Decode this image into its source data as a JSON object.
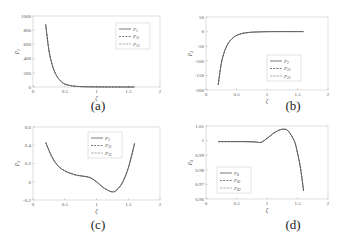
{
  "figure": {
    "captions": [
      "(a)",
      "(b)",
      "(c)",
      "(d)"
    ]
  },
  "chart_data": [
    {
      "type": "line",
      "panel": "(a)",
      "title": "",
      "xlabel": "ζ",
      "ylabel": "p1",
      "xlim": [
        0,
        2
      ],
      "ylim": [
        0,
        1000
      ],
      "xticks": [
        "0",
        "0.5",
        "1",
        "1.5",
        "2"
      ],
      "yticks": [
        "0",
        "200",
        "400",
        "600",
        "800",
        "1000"
      ],
      "legend": [
        "P1",
        "P11",
        "P12"
      ],
      "legend_position": "upper right",
      "grid": false,
      "x": [
        0.2,
        0.25,
        0.3,
        0.35,
        0.4,
        0.45,
        0.5,
        0.6,
        0.7,
        0.8,
        1.0,
        1.2,
        1.4,
        1.6
      ],
      "series": [
        {
          "name": "P1",
          "style": "solid",
          "values": [
            880,
            520,
            320,
            195,
            120,
            72,
            42,
            18,
            8,
            4,
            1,
            0.5,
            0.2,
            0.1
          ]
        },
        {
          "name": "P11",
          "style": "dashed",
          "values": [
            880,
            520,
            320,
            195,
            120,
            72,
            42,
            18,
            8,
            4,
            1,
            0.5,
            0.2,
            0.1
          ]
        },
        {
          "name": "P12",
          "style": "dotted",
          "values": [
            880,
            520,
            320,
            195,
            120,
            72,
            42,
            18,
            8,
            4,
            1,
            0.5,
            0.2,
            0.1
          ]
        }
      ]
    },
    {
      "type": "line",
      "panel": "(b)",
      "title": "",
      "xlabel": "ζ",
      "ylabel": "p2",
      "xlim": [
        0,
        2
      ],
      "ylim": [
        -200,
        50
      ],
      "xticks": [
        "0",
        "0.5",
        "1",
        "1.5",
        "2"
      ],
      "yticks": [
        "-200",
        "-150",
        "-100",
        "-50",
        "0",
        "50"
      ],
      "legend": [
        "P2",
        "P21",
        "P22"
      ],
      "legend_position": "lower right",
      "grid": false,
      "x": [
        0.2,
        0.25,
        0.3,
        0.35,
        0.4,
        0.45,
        0.5,
        0.6,
        0.7,
        0.8,
        1.0,
        1.2,
        1.4,
        1.6
      ],
      "series": [
        {
          "name": "P2",
          "style": "solid",
          "values": [
            -182,
            -110,
            -70,
            -45,
            -30,
            -20,
            -13,
            -6,
            -3,
            -1.5,
            -0.3,
            0,
            0,
            0
          ]
        },
        {
          "name": "P21",
          "style": "dashed",
          "values": [
            -182,
            -110,
            -70,
            -45,
            -30,
            -20,
            -13,
            -6,
            -3,
            -1.5,
            -0.3,
            0,
            0,
            0
          ]
        },
        {
          "name": "P22",
          "style": "dotted",
          "values": [
            -182,
            -110,
            -70,
            -45,
            -30,
            -20,
            -13,
            -6,
            -3,
            -1.5,
            -0.3,
            0,
            0,
            0
          ]
        }
      ]
    },
    {
      "type": "line",
      "panel": "(c)",
      "title": "",
      "xlabel": "ζ",
      "ylabel": "p3",
      "xlim": [
        0,
        2
      ],
      "ylim": [
        -0.2,
        0.6
      ],
      "xticks": [
        "0",
        "0.5",
        "1",
        "1.5",
        "2"
      ],
      "yticks": [
        "-0.2",
        "0",
        "0.2",
        "0.4",
        "0.6"
      ],
      "legend": [
        "P3",
        "P31",
        "P32"
      ],
      "legend_position": "upper center",
      "grid": false,
      "x": [
        0.2,
        0.3,
        0.4,
        0.5,
        0.6,
        0.7,
        0.8,
        0.9,
        1.0,
        1.1,
        1.2,
        1.25,
        1.3,
        1.4,
        1.5,
        1.6
      ],
      "series": [
        {
          "name": "P3",
          "style": "solid",
          "values": [
            0.43,
            0.27,
            0.17,
            0.12,
            0.09,
            0.07,
            0.06,
            0.045,
            0.0,
            -0.06,
            -0.1,
            -0.11,
            -0.1,
            -0.02,
            0.15,
            0.42
          ]
        },
        {
          "name": "P31",
          "style": "dashed",
          "values": [
            0.43,
            0.27,
            0.17,
            0.12,
            0.09,
            0.07,
            0.06,
            0.045,
            0.0,
            -0.06,
            -0.1,
            -0.11,
            -0.1,
            -0.02,
            0.15,
            0.42
          ]
        },
        {
          "name": "P32",
          "style": "dotted",
          "values": [
            0.43,
            0.27,
            0.17,
            0.12,
            0.09,
            0.07,
            0.06,
            0.045,
            0.0,
            -0.06,
            -0.1,
            -0.11,
            -0.1,
            -0.02,
            0.15,
            0.42
          ]
        }
      ]
    },
    {
      "type": "line",
      "panel": "(d)",
      "title": "",
      "xlabel": "ζ",
      "ylabel": "p4",
      "xlim": [
        0,
        2
      ],
      "ylim": [
        0.96,
        1.01
      ],
      "xticks": [
        "0",
        "0.5",
        "1",
        "1.5",
        "2"
      ],
      "yticks": [
        "0.96",
        "0.97",
        "0.98",
        "0.99",
        "1",
        "1.01"
      ],
      "legend": [
        "P4",
        "P41",
        "P42"
      ],
      "legend_position": "lower left",
      "grid": false,
      "x": [
        0.2,
        0.4,
        0.6,
        0.8,
        0.9,
        1.0,
        1.1,
        1.2,
        1.28,
        1.35,
        1.45,
        1.5,
        1.55,
        1.6
      ],
      "series": [
        {
          "name": "P4",
          "style": "solid",
          "values": [
            0.9993,
            0.9993,
            0.9993,
            0.9991,
            0.9988,
            1.0015,
            1.0048,
            1.0072,
            1.0078,
            1.0065,
            0.9995,
            0.9915,
            0.981,
            0.9655
          ]
        },
        {
          "name": "P41",
          "style": "dashed",
          "values": [
            0.9993,
            0.9993,
            0.9993,
            0.9991,
            0.9988,
            1.0015,
            1.0048,
            1.0072,
            1.0078,
            1.0065,
            0.9995,
            0.9915,
            0.981,
            0.9655
          ]
        },
        {
          "name": "P42",
          "style": "dotted",
          "values": [
            0.9993,
            0.9993,
            0.9993,
            0.9991,
            0.9988,
            1.0015,
            1.0048,
            1.0072,
            1.0078,
            1.0065,
            0.9995,
            0.9915,
            0.981,
            0.9655
          ]
        }
      ]
    }
  ]
}
